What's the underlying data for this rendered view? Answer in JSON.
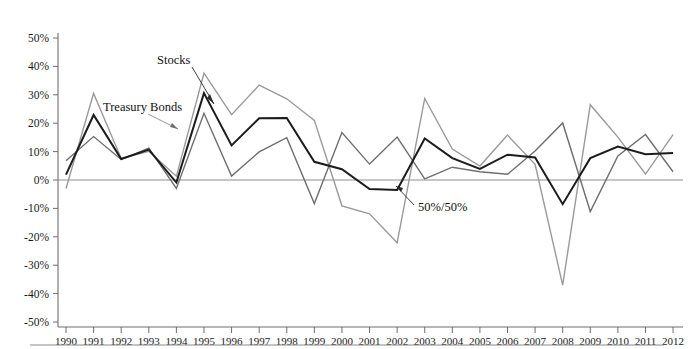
{
  "chart_data": {
    "type": "line",
    "title": "",
    "subtitle": "",
    "xlabel": "",
    "ylabel": "",
    "grid": false,
    "legend_position": "inline-annotations",
    "ylim": [
      -50,
      50
    ],
    "y_ticks": [
      50,
      40,
      30,
      20,
      10,
      0,
      -10,
      -20,
      -30,
      -40,
      -50
    ],
    "y_tick_labels": [
      "50%",
      "40%",
      "30%",
      "20%",
      "10%",
      "0%",
      "-10%",
      "-20%",
      "-30%",
      "-40%",
      "-50%"
    ],
    "categories": [
      "1990",
      "1991",
      "1992",
      "1993",
      "1994",
      "1995",
      "1996",
      "1997",
      "1998",
      "1999",
      "2000",
      "2001",
      "2002",
      "2003",
      "2004",
      "2005",
      "2006",
      "2007",
      "2008",
      "2009",
      "2010",
      "2011",
      "2012"
    ],
    "series": [
      {
        "name": "Stocks",
        "color": "#9a9a9a",
        "values": [
          -3,
          30.5,
          7.6,
          10.1,
          1.3,
          37.6,
          23.0,
          33.4,
          28.6,
          21.0,
          -9.1,
          -11.9,
          -22.1,
          28.7,
          10.9,
          4.9,
          15.8,
          5.5,
          -37.0,
          26.5,
          15.1,
          2.1,
          16.0
        ]
      },
      {
        "name": "Treasury Bonds",
        "color": "#6e6e6e",
        "values": [
          6.8,
          15.3,
          7.2,
          11.2,
          -3.0,
          23.5,
          1.4,
          9.9,
          14.9,
          -8.3,
          16.7,
          5.6,
          15.1,
          0.4,
          4.5,
          2.9,
          2.0,
          10.2,
          20.1,
          -11.1,
          8.5,
          16.0,
          2.9
        ]
      },
      {
        "name": "50%/50%",
        "color": "#1c1c1c",
        "values": [
          1.9,
          22.9,
          7.4,
          10.7,
          -0.9,
          30.6,
          12.2,
          21.7,
          21.8,
          6.4,
          3.8,
          -3.2,
          -3.5,
          14.6,
          7.7,
          3.9,
          8.9,
          7.9,
          -8.5,
          7.7,
          11.8,
          9.1,
          9.5
        ]
      }
    ],
    "annotations": [
      {
        "text": "Stocks",
        "target_series": "Stocks",
        "target_year": "1995"
      },
      {
        "text": "Treasury Bonds",
        "target_series": "Treasury Bonds",
        "target_year": "1993"
      },
      {
        "text": "50%/50%",
        "target_series": "50%/50%",
        "target_year": "2002"
      }
    ]
  },
  "axes": {
    "y_axis_name": "percent-return-axis",
    "x_axis_name": "year-axis"
  }
}
